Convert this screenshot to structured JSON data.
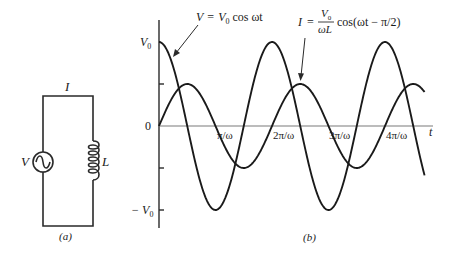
{
  "panel_a": {
    "caption": "(a)",
    "current_label": "I",
    "source_label": "V",
    "inductor_label": "L",
    "source_icon": "ac-source-icon",
    "inductor_icon": "inductor-coil-icon"
  },
  "panel_b": {
    "caption": "(b)",
    "y_labels": {
      "top": "V",
      "top_sub": "0",
      "zero": "0",
      "bottom": "− V",
      "bottom_sub": "0"
    },
    "x_axis_label": "t",
    "x_ticks": [
      "π/ω",
      "2π/ω",
      "3π/ω",
      "4π/ω"
    ],
    "voltage_annotation": {
      "lhs": "V",
      "eq": "=",
      "coef": "V",
      "coef_sub": "0",
      "fn": "cos ωt"
    },
    "current_annotation": {
      "lhs": "I",
      "eq": "=",
      "num": "V",
      "num_sub": "0",
      "den": "ωL",
      "fn": "cos(ωt − π/2)"
    }
  },
  "chart_data": {
    "type": "line",
    "title": "",
    "xlabel": "t",
    "ylabel": "",
    "x_unit": "π/ω",
    "x_ticks": [
      1,
      2,
      3,
      4
    ],
    "x_tick_labels": [
      "π/ω",
      "2π/ω",
      "3π/ω",
      "4π/ω"
    ],
    "y_ticks": [
      -1,
      0,
      1
    ],
    "y_tick_labels": [
      "−V0",
      "0",
      "V0"
    ],
    "xlim": [
      0,
      4.7
    ],
    "ylim": [
      -1,
      1
    ],
    "grid": false,
    "series": [
      {
        "name": "V = V0 cos ωt",
        "amplitude": 1.0,
        "phase": 0,
        "x": [
          0,
          0.5,
          1,
          1.5,
          2,
          2.5,
          3,
          3.5,
          4,
          4.5,
          4.69
        ],
        "values": [
          1,
          0,
          -1,
          0,
          1,
          0,
          -1,
          0,
          1,
          0,
          -0.56
        ]
      },
      {
        "name": "I = (V0/ωL) cos(ωt − π/2)",
        "amplitude": 0.5,
        "phase": -1.5708,
        "x": [
          0,
          0.5,
          1,
          1.5,
          2,
          2.5,
          3,
          3.5,
          4,
          4.5,
          4.69
        ],
        "values": [
          0,
          0.5,
          0,
          -0.5,
          0,
          0.5,
          0,
          -0.5,
          0,
          0.5,
          0.41
        ]
      }
    ]
  }
}
